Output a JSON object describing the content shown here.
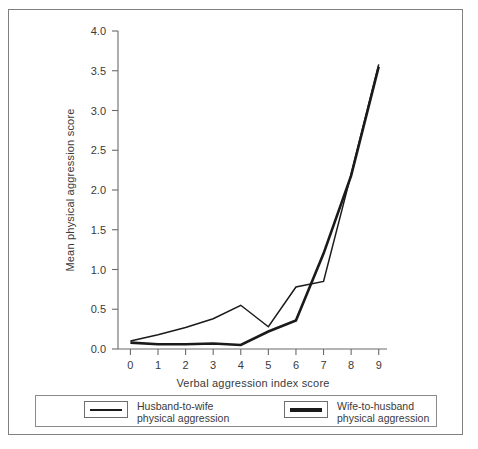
{
  "chart_data": {
    "type": "line",
    "title": "",
    "xlabel": "Verbal aggression index score",
    "ylabel": "Mean physical aggression score",
    "xlim": [
      -0.45,
      9.3
    ],
    "ylim": [
      0.0,
      4.0
    ],
    "xticks": [
      "0",
      "1",
      "2",
      "3",
      "4",
      "5",
      "6",
      "7",
      "8",
      "9"
    ],
    "yticks": [
      "0.0",
      "0.5",
      "1.0",
      "1.5",
      "2.0",
      "2.5",
      "3.0",
      "3.5",
      "4.0"
    ],
    "grid": false,
    "legend_position": "bottom",
    "x": [
      0,
      1,
      2,
      3,
      4,
      5,
      6,
      7,
      8,
      9
    ],
    "series": [
      {
        "name": "Husband-to-wife physical aggression",
        "legend_line_1": "Husband-to-wife",
        "legend_line_2": "physical aggression",
        "style": "thin",
        "color": "#1a1a1a",
        "values": [
          0.1,
          0.18,
          0.27,
          0.38,
          0.55,
          0.28,
          0.78,
          0.85,
          2.2,
          3.58
        ]
      },
      {
        "name": "Wife-to-husband physical aggression",
        "legend_line_1": "Wife-to-husband",
        "legend_line_2": "physical aggression",
        "style": "thick",
        "color": "#1a1a1a",
        "values": [
          0.08,
          0.06,
          0.06,
          0.07,
          0.05,
          0.22,
          0.36,
          1.2,
          2.18,
          3.55
        ]
      }
    ]
  },
  "axes": {
    "x_title": "Verbal aggression index score",
    "y_title": "Mean physical aggression score"
  },
  "legend": {
    "items": [
      {
        "line_1": "Husband-to-wife",
        "line_2": "physical aggression",
        "swatch": "thin-line-swatch"
      },
      {
        "line_1": "Wife-to-husband",
        "line_2": "physical aggression",
        "swatch": "thick-line-swatch"
      }
    ]
  }
}
